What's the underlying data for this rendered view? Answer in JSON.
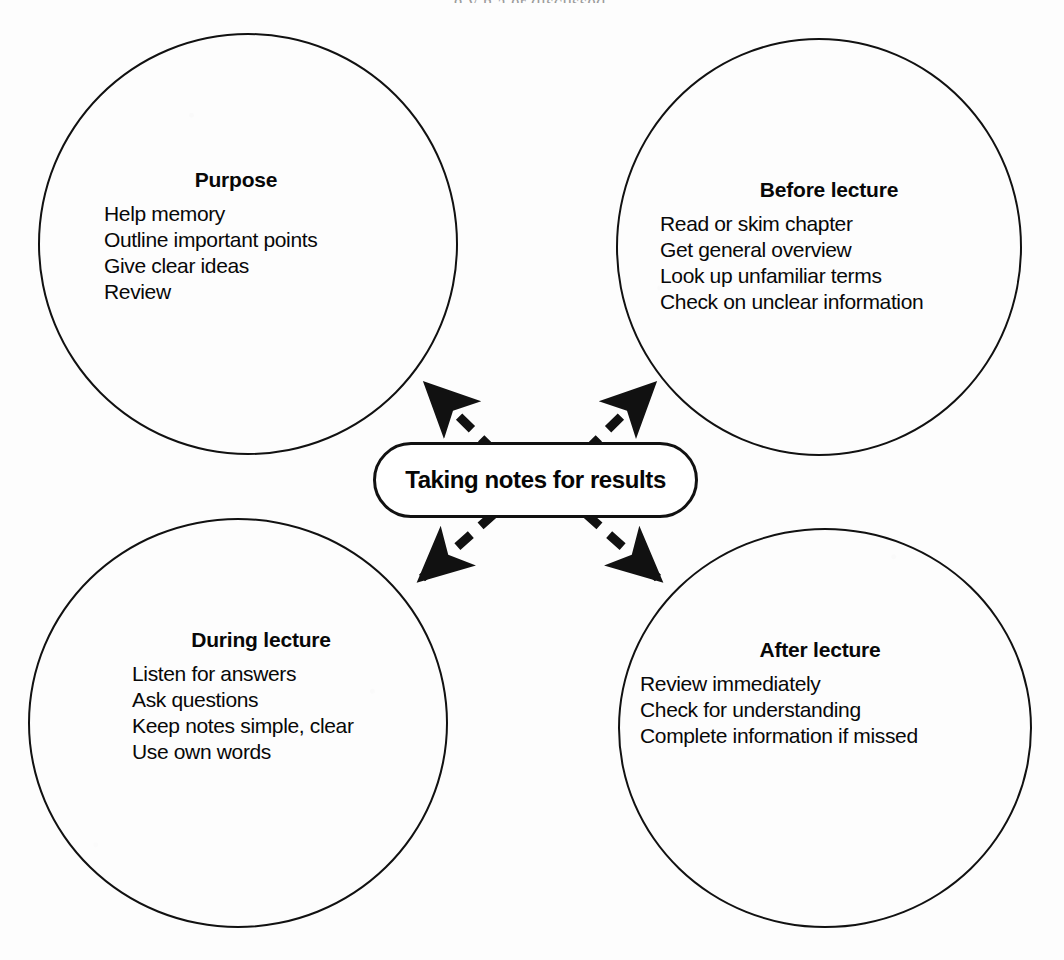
{
  "page": {
    "top_caption": "g                          y                                  h    a   er  discussed.",
    "background_color": "#fdfdfd",
    "ink_color": "#111111"
  },
  "center": {
    "label": "Taking notes for results",
    "shape": "rounded-capsule"
  },
  "nodes": [
    {
      "id": "purpose",
      "heading": "Purpose",
      "items": [
        "Help memory",
        "Outline important points",
        "Give clear ideas",
        "Review"
      ]
    },
    {
      "id": "before-lecture",
      "heading": "Before lecture",
      "items": [
        "Read or skim chapter",
        "Get general overview",
        "Look up unfamiliar terms",
        "Check on unclear information"
      ]
    },
    {
      "id": "during-lecture",
      "heading": "During lecture",
      "items": [
        "Listen for answers",
        "Ask questions",
        "Keep notes simple, clear",
        "Use own words"
      ]
    },
    {
      "id": "after-lecture",
      "heading": "After lecture",
      "items": [
        "Review immediately",
        "Check for understanding",
        "Complete information if missed"
      ]
    }
  ],
  "connectors": [
    {
      "id": "center-to-purpose",
      "style": "dashed",
      "arrowhead": "end",
      "direction": "up-left"
    },
    {
      "id": "center-to-before-lecture",
      "style": "dashed",
      "arrowhead": "end",
      "direction": "up-right"
    },
    {
      "id": "center-to-during-lecture",
      "style": "dashed",
      "arrowhead": "end",
      "direction": "down-left"
    },
    {
      "id": "center-to-after-lecture",
      "style": "dashed",
      "arrowhead": "end",
      "direction": "down-right"
    }
  ]
}
